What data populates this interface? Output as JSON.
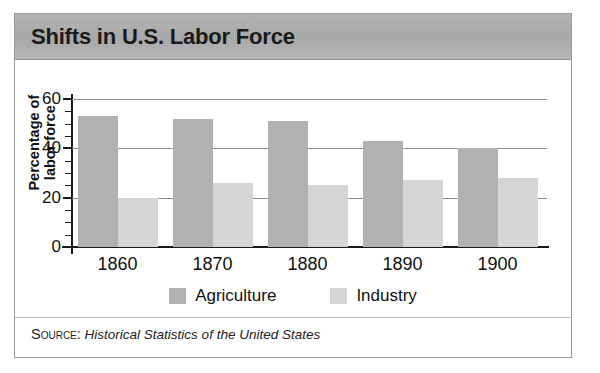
{
  "figure": {
    "title": "Shifts in U.S. Labor Force",
    "source_label": "Source:",
    "source_text": "Historical Statistics of the United States"
  },
  "colors": {
    "header_band": "#a8a8a8",
    "agriculture": "#b0b2b0",
    "industry": "#d4d6d4",
    "axis": "#1a1a1a",
    "gridline": "#8d8d8d",
    "border": "#9a9a9a"
  },
  "chart_data": {
    "type": "bar",
    "title": "Shifts in U.S. Labor Force",
    "xlabel": "",
    "ylabel": "Percentage of labor force",
    "categories": [
      "1860",
      "1870",
      "1880",
      "1890",
      "1900"
    ],
    "series": [
      {
        "name": "Agriculture",
        "values": [
          53,
          52,
          51,
          43,
          40
        ],
        "color": "#b0b2b0"
      },
      {
        "name": "Industry",
        "values": [
          20,
          26,
          25,
          27,
          28
        ],
        "color": "#d4d6d4"
      }
    ],
    "ylim": [
      0,
      60
    ],
    "yticks": [
      0,
      20,
      40,
      60
    ],
    "ytick_labels": [
      "0",
      "20",
      "40",
      "60"
    ],
    "yminor_ticks": [
      5,
      10,
      15,
      25,
      30,
      35,
      45,
      50,
      55
    ],
    "grid": true,
    "legend_position": "bottom"
  }
}
